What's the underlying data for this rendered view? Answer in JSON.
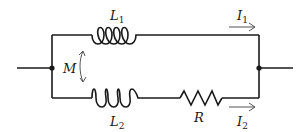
{
  "diagram": {
    "type": "circuit",
    "components": {
      "L1": {
        "symbol": "L",
        "subscript": "1",
        "kind": "inductor",
        "branch": "top"
      },
      "L2": {
        "symbol": "L",
        "subscript": "2",
        "kind": "inductor",
        "branch": "bottom"
      },
      "R": {
        "symbol": "R",
        "subscript": "",
        "kind": "resistor",
        "branch": "bottom"
      },
      "M": {
        "symbol": "M",
        "kind": "mutual-inductance",
        "between": [
          "L1",
          "L2"
        ]
      }
    },
    "currents": {
      "I1": {
        "symbol": "I",
        "subscript": "1",
        "branch": "top",
        "direction": "right"
      },
      "I2": {
        "symbol": "I",
        "subscript": "2",
        "branch": "bottom",
        "direction": "right"
      }
    },
    "nodes": [
      "left-junction",
      "right-junction"
    ],
    "colors": {
      "wire": "#1a1a1a",
      "arrow": "#555555",
      "background": "#ffffff"
    }
  }
}
